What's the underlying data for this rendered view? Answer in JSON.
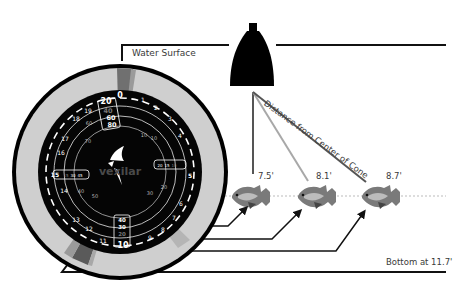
{
  "labels": {
    "water_surface": "Water Surface",
    "distance_from_center": "Distance from Center of Cone",
    "bottom": "Bottom at 11.7'"
  },
  "targets": [
    {
      "name": "fish-1",
      "depth_label": "7.5'"
    },
    {
      "name": "fish-2",
      "depth_label": "8.1'"
    },
    {
      "name": "fish-3",
      "depth_label": "8.7'"
    }
  ],
  "dial": {
    "brand": "vexilar",
    "zero_mark": "0",
    "outer_numbers": [
      "1",
      "2",
      "3",
      "4",
      "5",
      "6",
      "7",
      "8",
      "9",
      "10",
      "11",
      "12",
      "13",
      "14",
      "15",
      "16",
      "17",
      "18",
      "19",
      "20"
    ],
    "range_top": [
      "20",
      "40",
      "60",
      "80"
    ],
    "range_bottom": [
      "40",
      "30",
      "20",
      "10"
    ],
    "right_box": [
      "20",
      "15",
      "10",
      "5"
    ],
    "left_box": [
      "15",
      "30",
      "45",
      "60"
    ],
    "inner_numbers": [
      "10",
      "10",
      "20",
      "30",
      "30",
      "40",
      "50",
      "60",
      "70"
    ]
  },
  "colors": {
    "ink": "#111111",
    "ring_light": "#c9c9c9",
    "face": "#050505",
    "line_gray": "#9a9a9a",
    "line_dark": "#555555",
    "text": "#3a3a3a"
  }
}
